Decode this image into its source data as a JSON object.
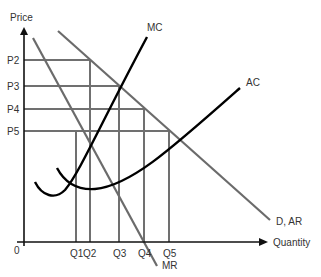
{
  "diagram": {
    "axes": {
      "y_label": "Price",
      "x_label": "Quantity",
      "origin_label": "0"
    },
    "price_levels": [
      {
        "label": "P2",
        "y": 60
      },
      {
        "label": "P3",
        "y": 86
      },
      {
        "label": "P4",
        "y": 109
      },
      {
        "label": "P5",
        "y": 131
      }
    ],
    "quantity_levels": [
      {
        "label": "Q1",
        "x": 76
      },
      {
        "label": "Q2",
        "x": 90
      },
      {
        "label": "Q3",
        "x": 119
      },
      {
        "label": "Q4",
        "x": 144
      },
      {
        "label": "Q5",
        "x": 169
      }
    ],
    "curves": [
      {
        "name": "MC",
        "label": "MC",
        "color": "#000000"
      },
      {
        "name": "AC",
        "label": "AC",
        "color": "#000000"
      },
      {
        "name": "D_AR",
        "label": "D, AR",
        "color": "#6b6b6b"
      },
      {
        "name": "MR",
        "label": "MR",
        "color": "#6b6b6b"
      }
    ],
    "colors": {
      "axis": "#111111",
      "guide": "#707070",
      "demand": "#6b6b6b",
      "cost": "#000000",
      "text": "#333333"
    }
  }
}
